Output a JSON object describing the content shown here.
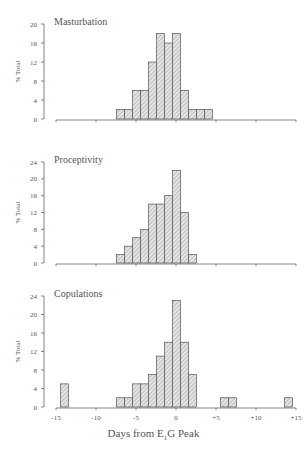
{
  "chart_data": [
    {
      "type": "bar",
      "title": "Masturbation",
      "ylabel": "% Total",
      "xlabel": "Days from E1G Peak",
      "ylim": [
        0,
        20
      ],
      "yticks": [
        0,
        4,
        8,
        12,
        16,
        20
      ],
      "xlim": [
        -15,
        15
      ],
      "xticks": [
        -15,
        -10,
        -5,
        0,
        5,
        10,
        15
      ],
      "grid": false,
      "x": [
        -7,
        -6,
        -5,
        -4,
        -3,
        -2,
        -1,
        0,
        1,
        2,
        3,
        4
      ],
      "values": [
        2,
        2,
        6,
        6,
        12,
        18,
        16,
        18,
        6,
        2,
        2,
        2
      ]
    },
    {
      "type": "bar",
      "title": "Proceptivity",
      "ylabel": "% Total",
      "xlabel": "Days from E1G Peak",
      "ylim": [
        0,
        24
      ],
      "yticks": [
        0,
        4,
        8,
        12,
        16,
        20,
        24
      ],
      "xlim": [
        -15,
        15
      ],
      "xticks": [
        -15,
        -10,
        -5,
        0,
        5,
        10,
        15
      ],
      "grid": false,
      "x": [
        -7,
        -6,
        -5,
        -4,
        -3,
        -2,
        -1,
        0,
        1,
        2
      ],
      "values": [
        2,
        4,
        6,
        8,
        14,
        14,
        16,
        22,
        12,
        2
      ]
    },
    {
      "type": "bar",
      "title": "Copulations",
      "ylabel": "% Total",
      "xlabel": "Days from E1G Peak",
      "ylim": [
        0,
        24
      ],
      "yticks": [
        0,
        4,
        8,
        12,
        16,
        20,
        24
      ],
      "xlim": [
        -15,
        15
      ],
      "xticks": [
        -15,
        -10,
        -5,
        0,
        5,
        10,
        15
      ],
      "grid": false,
      "x": [
        -14,
        -7,
        -6,
        -5,
        -4,
        -3,
        -2,
        -1,
        0,
        1,
        2,
        6,
        7,
        14
      ],
      "values": [
        5,
        2,
        2,
        5,
        5,
        7,
        11,
        14,
        23,
        14,
        7,
        2,
        2,
        2
      ]
    }
  ],
  "axis": {
    "xtick_labels": [
      "-15",
      "-10",
      "-5",
      "0",
      "+5",
      "+10",
      "+15"
    ],
    "xlabel_main": "Days from E",
    "xlabel_sub": "1",
    "xlabel_rest": "G Peak"
  },
  "colors": {
    "bar_fill": "#d9d9d9",
    "bar_stroke": "#555555",
    "axis": "#666666",
    "text": "#555555"
  }
}
